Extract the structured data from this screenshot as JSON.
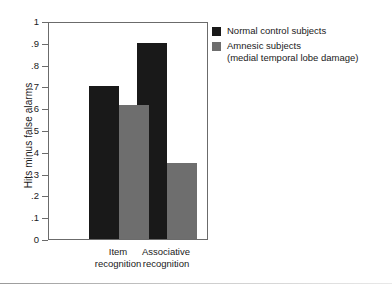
{
  "chart_data": {
    "type": "bar",
    "title": "",
    "xlabel": "",
    "ylabel": "Hits minus false alarms",
    "categories": [
      "Item\nrecognition",
      "Associative\nrecognition"
    ],
    "category_lines": [
      [
        "Item",
        "recognition"
      ],
      [
        "Associative",
        "recognition"
      ]
    ],
    "series": [
      {
        "name": "Normal control subjects",
        "color": "#191919",
        "values": [
          0.7,
          0.9
        ]
      },
      {
        "name": "Amnesic subjects",
        "name_line2": "(medial temporal lobe damage)",
        "color": "#6e6e6e",
        "values": [
          0.615,
          0.35
        ]
      }
    ],
    "ylim": [
      0,
      1
    ],
    "ytick_values": [
      0,
      0.1,
      0.2,
      0.3,
      0.4,
      0.5,
      0.6,
      0.7,
      0.8,
      0.9,
      1
    ],
    "ytick_labels": [
      "0",
      ".1",
      ".2",
      ".3",
      ".4",
      ".5",
      ".6",
      ".7",
      ".8",
      ".9",
      "1"
    ],
    "grid": false,
    "legend_position": "right-top",
    "frame": true
  },
  "legend": {
    "entries": [
      {
        "label": "Normal control subjects",
        "sublabel": ""
      },
      {
        "label": "Amnesic subjects",
        "sublabel": "(medial temporal lobe damage)"
      }
    ]
  },
  "axes": {
    "y_title": "Hits minus false alarms"
  }
}
